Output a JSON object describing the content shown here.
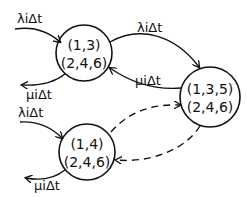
{
  "diagram": {
    "states": [
      {
        "id": "s1",
        "line1": "(1,3)",
        "line2": "(2,4,6)"
      },
      {
        "id": "s2",
        "line1": "(1,3,5)",
        "line2": "(2,4,6)"
      },
      {
        "id": "s3",
        "line1": "(1,4)",
        "line2": "(2,4,6)"
      }
    ],
    "edges": {
      "in_s1": "λiΔt",
      "out_s1": "μiΔt",
      "s1_to_s2": "λiΔt",
      "s2_to_s1": "μiΔt",
      "in_s3": "λiΔt",
      "out_s3": "μiΔt"
    }
  }
}
